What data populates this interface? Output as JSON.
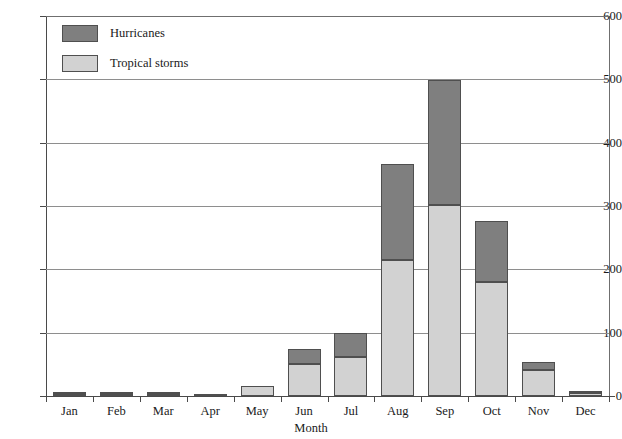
{
  "chart_data": {
    "type": "bar",
    "stacked": true,
    "title": "",
    "xlabel": "Month",
    "ylabel": "Number",
    "categories": [
      "Jan",
      "Feb",
      "Mar",
      "Apr",
      "May",
      "Jun",
      "Jul",
      "Aug",
      "Sep",
      "Oct",
      "Nov",
      "Dec"
    ],
    "series": [
      {
        "name": "Tropical storms",
        "color": "#d2d2d2",
        "values": [
          1,
          1,
          2,
          1,
          16,
          50,
          61,
          214,
          301,
          180,
          41,
          4
        ]
      },
      {
        "name": "Hurricanes",
        "color": "#7f7f7f",
        "values": [
          1,
          1,
          2,
          0,
          0,
          24,
          39,
          153,
          198,
          97,
          13,
          2
        ]
      }
    ],
    "totals": [
      2,
      2,
      4,
      1,
      16,
      74,
      100,
      367,
      499,
      277,
      54,
      6
    ],
    "ylim": [
      0,
      600
    ],
    "yticks": [
      0,
      100,
      200,
      300,
      400,
      500,
      600
    ],
    "ytick_labels": [
      "0",
      "100",
      "200",
      "300",
      "400",
      "500",
      "600"
    ],
    "grid": true,
    "legend_position": "top-left"
  },
  "legend": {
    "items": [
      {
        "label": "Hurricanes",
        "color": "#7f7f7f"
      },
      {
        "label": "Tropical storms",
        "color": "#d2d2d2"
      }
    ]
  }
}
